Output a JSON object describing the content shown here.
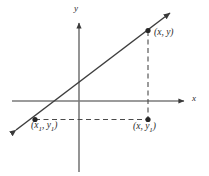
{
  "figure": {
    "kind": "cartesian-coordinate-diagram",
    "background_color": "#ffffff",
    "axis_color": "#6e6e6e",
    "line_color": "#3a3a3a",
    "dash_color": "#4a4a4a",
    "point_color": "#2b2b2b",
    "label_color": "#2b2b2b"
  },
  "axes": {
    "x_label": "x",
    "y_label": "y",
    "x_axis": {
      "x1": 12,
      "y1": 101,
      "x2": 185,
      "y2": 101,
      "arrow": "right"
    },
    "y_axis": {
      "x1": 79,
      "y1": 172,
      "x2": 79,
      "y2": 22,
      "arrow": "up"
    },
    "origin": {
      "x": 79,
      "y": 101
    }
  },
  "line": {
    "label": "line-through-points",
    "start": {
      "x": 14,
      "y": 132
    },
    "end": {
      "x": 172,
      "y": 11
    },
    "arrows": "both"
  },
  "points": [
    {
      "name": "point-xy",
      "label": "(x, y)",
      "x_text": "x",
      "y_text": "y",
      "x": 148,
      "y": 30
    },
    {
      "name": "point-x1y1",
      "label": "(x1, y1)",
      "x_text": "x",
      "x_sub": "1",
      "y_text": "y",
      "y_sub": "1",
      "x": 35,
      "y": 119
    },
    {
      "name": "point-xy1",
      "label": "(x, y1)",
      "x_text": "x",
      "y_text": "y",
      "y_sub": "1",
      "x": 148,
      "y": 120
    }
  ],
  "dashed_segments": [
    {
      "name": "horizontal-leg",
      "from": {
        "x": 35,
        "y": 119
      },
      "to": {
        "x": 148,
        "y": 119
      }
    },
    {
      "name": "vertical-leg",
      "from": {
        "x": 148,
        "y": 31
      },
      "to": {
        "x": 148,
        "y": 119
      }
    }
  ]
}
